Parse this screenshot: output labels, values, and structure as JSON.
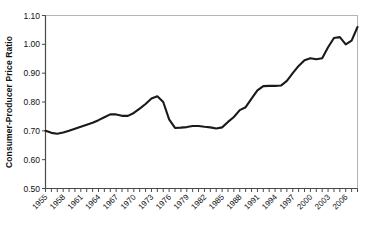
{
  "chart_data": {
    "type": "line",
    "title": "",
    "subtitle": "",
    "xlabel": "",
    "ylabel": "Consumer-Producer Price Ratio",
    "xlim": [
      1955,
      2008
    ],
    "ylim": [
      0.5,
      1.1
    ],
    "grid": false,
    "legend": null,
    "legend_position": "none",
    "y_ticks": [
      0.5,
      0.6,
      0.7,
      0.8,
      0.9,
      1.0,
      1.1
    ],
    "y_tick_labels": [
      "0.50",
      "0.60",
      "0.70",
      "0.80",
      "0.90",
      "1.00",
      "1.10"
    ],
    "x_ticks": [
      1955,
      1958,
      1961,
      1964,
      1967,
      1970,
      1973,
      1976,
      1979,
      1982,
      1985,
      1988,
      1991,
      1994,
      1997,
      2000,
      2003,
      2006
    ],
    "x_tick_labels": [
      "1955",
      "1958",
      "1961",
      "1964",
      "1967",
      "1970",
      "1973",
      "1976",
      "1979",
      "1982",
      "1985",
      "1988",
      "1991",
      "1994",
      "1997",
      "2000",
      "2003",
      "2006"
    ],
    "x_minor_tick_interval": 1,
    "series": [
      {
        "name": "Consumer-Producer Price Ratio",
        "color": "#1a1a1a",
        "x": [
          1955,
          1956,
          1957,
          1958,
          1959,
          1960,
          1961,
          1962,
          1963,
          1964,
          1965,
          1966,
          1967,
          1968,
          1969,
          1970,
          1971,
          1972,
          1973,
          1974,
          1975,
          1976,
          1977,
          1978,
          1979,
          1980,
          1981,
          1982,
          1983,
          1984,
          1985,
          1986,
          1987,
          1988,
          1989,
          1990,
          1991,
          1992,
          1993,
          1994,
          1995,
          1996,
          1997,
          1998,
          1999,
          2000,
          2001,
          2002,
          2003,
          2004,
          2005,
          2006,
          2007,
          2008
        ],
        "values": [
          0.7,
          0.693,
          0.69,
          0.694,
          0.7,
          0.707,
          0.714,
          0.721,
          0.728,
          0.737,
          0.747,
          0.757,
          0.757,
          0.752,
          0.752,
          0.762,
          0.777,
          0.793,
          0.812,
          0.82,
          0.8,
          0.74,
          0.71,
          0.711,
          0.713,
          0.717,
          0.717,
          0.714,
          0.712,
          0.708,
          0.712,
          0.731,
          0.748,
          0.772,
          0.782,
          0.812,
          0.84,
          0.855,
          0.856,
          0.856,
          0.857,
          0.873,
          0.9,
          0.925,
          0.945,
          0.952,
          0.948,
          0.952,
          0.99,
          1.022,
          1.025,
          1.0,
          1.013,
          1.06
        ]
      }
    ],
    "annotations": []
  },
  "axes": {
    "y_axis_title": "Consumer-Producer Price Ratio"
  }
}
